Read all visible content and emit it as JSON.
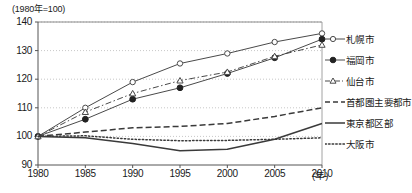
{
  "chart_data": {
    "type": "line",
    "title": "",
    "ylabel_note": "(1980年=100)",
    "xlabel": "(年)",
    "x": [
      1980,
      1985,
      1990,
      1995,
      2000,
      2005,
      2010
    ],
    "xtick_labels": [
      "1980",
      "1985",
      "1990",
      "1995",
      "2000",
      "2005",
      "2010"
    ],
    "ytick_labels": [
      "90",
      "100",
      "110",
      "120",
      "130",
      "140"
    ],
    "yticks": [
      90,
      100,
      110,
      120,
      130,
      140
    ],
    "ylim": [
      90,
      140
    ],
    "xlim": [
      1980,
      2010
    ],
    "grid": "horizontal-dotted",
    "legend_position": "right",
    "series": [
      {
        "name": "札幌市",
        "marker": "open-circle",
        "line": "solid",
        "values": [
          100,
          110,
          119,
          125.5,
          129,
          133,
          136
        ]
      },
      {
        "name": "福岡市",
        "marker": "filled-circle",
        "line": "solid",
        "values": [
          100,
          106,
          113,
          117,
          122,
          127.5,
          134
        ]
      },
      {
        "name": "仙台市",
        "marker": "open-triangle",
        "line": "dash-dot",
        "values": [
          100,
          108.5,
          115,
          119.5,
          122.5,
          128,
          132
        ]
      },
      {
        "name": "首都圏主要都市",
        "marker": "none",
        "line": "dashed",
        "values": [
          100,
          101.5,
          103,
          103.5,
          104.5,
          107,
          110
        ]
      },
      {
        "name": "東京都区部",
        "marker": "none",
        "line": "solid",
        "values": [
          100,
          99.5,
          97.5,
          95,
          95.5,
          99,
          104.5
        ]
      },
      {
        "name": "大阪市",
        "marker": "none",
        "line": "dotted",
        "values": [
          100,
          100.2,
          99,
          98.5,
          98.6,
          99,
          99.5
        ]
      }
    ]
  },
  "legend": {
    "items": [
      {
        "label": "札幌市"
      },
      {
        "label": "福岡市"
      },
      {
        "label": "仙台市"
      },
      {
        "label": "首都圏主要都市"
      },
      {
        "label": "東京都区部"
      },
      {
        "label": "大阪市"
      }
    ]
  },
  "colors": {
    "line": "#4a4a4a",
    "grid": "#b9b9b9",
    "axis": "#8a8a8a",
    "text": "#1a1a1a"
  }
}
